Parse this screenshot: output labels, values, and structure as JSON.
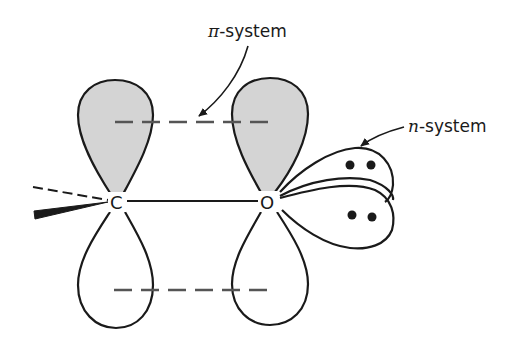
{
  "diagram": {
    "type": "molecular-orbital-diagram",
    "labels": {
      "pi_system": {
        "symbol": "π",
        "suffix": "-system"
      },
      "n_system": {
        "symbol": "n",
        "suffix": "-system"
      }
    },
    "atoms": {
      "carbon": "C",
      "oxygen": "O"
    },
    "colors": {
      "line": "#1a1a1a",
      "shaded_lobe": "#d4d4d4",
      "background": "#ffffff"
    },
    "elements": {
      "p_orbitals": [
        "carbon p-orbital (upper shaded, lower open)",
        "oxygen p-orbital (upper shaded, lower open)"
      ],
      "pi_overlap_lines": [
        "upper dashed",
        "lower dashed"
      ],
      "bonds": [
        "C–O sigma bond",
        "dashed wedge bond",
        "solid wedge bond"
      ],
      "lone_pair_lobes": [
        {
          "electrons": 2
        },
        {
          "electrons": 2
        }
      ]
    }
  }
}
